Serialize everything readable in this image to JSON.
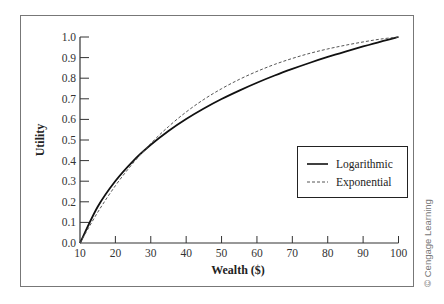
{
  "chart_data": {
    "type": "line",
    "title": "",
    "xlabel": "Wealth ($)",
    "ylabel": "Utility",
    "xlim": [
      10,
      100
    ],
    "ylim": [
      0.0,
      1.0
    ],
    "grid": false,
    "legend_position": "center-right",
    "x_ticks": [
      10,
      20,
      30,
      40,
      50,
      60,
      70,
      80,
      90,
      100
    ],
    "x_tick_labels": [
      "10",
      "20",
      "30",
      "40",
      "50",
      "60",
      "70",
      "80",
      "90",
      "100"
    ],
    "y_ticks": [
      0.0,
      0.1,
      0.2,
      0.3,
      0.4,
      0.5,
      0.6,
      0.7,
      0.8,
      0.9,
      1.0
    ],
    "y_tick_labels": [
      "0.0",
      "0.1",
      "0.2",
      "0.3",
      "0.4",
      "0.5",
      "0.6",
      "0.7",
      "0.8",
      "0.9",
      "1.0"
    ],
    "x": [
      10,
      15,
      20,
      25,
      30,
      35,
      40,
      45,
      50,
      55,
      60,
      65,
      70,
      75,
      80,
      85,
      90,
      95,
      100
    ],
    "series": [
      {
        "name": "Logarithmic",
        "style": "solid",
        "color": "#111111",
        "values": [
          0.0,
          0.176,
          0.301,
          0.398,
          0.477,
          0.544,
          0.602,
          0.653,
          0.699,
          0.74,
          0.778,
          0.813,
          0.845,
          0.875,
          0.903,
          0.929,
          0.954,
          0.978,
          1.0
        ]
      },
      {
        "name": "Exponential",
        "style": "dashed",
        "color": "#555555",
        "values": [
          0.0,
          0.149,
          0.278,
          0.388,
          0.483,
          0.565,
          0.636,
          0.697,
          0.749,
          0.794,
          0.833,
          0.867,
          0.896,
          0.921,
          0.942,
          0.96,
          0.976,
          0.99,
          1.0
        ]
      }
    ]
  },
  "credit": "© Cengage Learning"
}
